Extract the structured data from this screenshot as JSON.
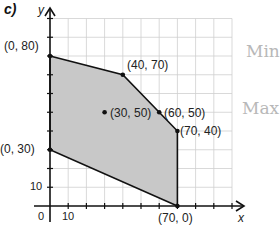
{
  "part_label": "c)",
  "handwriting": [
    "Min",
    "Max"
  ],
  "chart_data": {
    "type": "scatter",
    "title": "c)",
    "xlabel": "x",
    "ylabel": "y",
    "xlim": [
      0,
      100
    ],
    "ylim": [
      0,
      100
    ],
    "grid": true,
    "tick_labels": {
      "x": [
        "0",
        "10"
      ],
      "y": [
        "10"
      ]
    },
    "feasible_region_vertices": [
      {
        "x": 0,
        "y": 80,
        "label": "(0, 80)"
      },
      {
        "x": 40,
        "y": 70,
        "label": "(40, 70)"
      },
      {
        "x": 60,
        "y": 50,
        "label": "(60, 50)"
      },
      {
        "x": 70,
        "y": 40,
        "label": "(70, 40)"
      },
      {
        "x": 70,
        "y": 0,
        "label": "(70, 0)"
      },
      {
        "x": 0,
        "y": 30,
        "label": "(0, 30)"
      }
    ],
    "interior_points": [
      {
        "x": 30,
        "y": 50,
        "label": "(30, 50)"
      }
    ],
    "region_fill": "#c8c8c8"
  },
  "labels": {
    "p0_80": "(0, 80)",
    "p40_70": "(40, 70)",
    "p30_50": "(30, 50)",
    "p60_50": "(60, 50)",
    "p70_40": "(70, 40)",
    "p0_30": "(0, 30)",
    "p70_0": "(70, 0)",
    "x_axis": "x",
    "y_axis": "y",
    "tick_x0": "0",
    "tick_x10": "10",
    "tick_y10": "10"
  }
}
